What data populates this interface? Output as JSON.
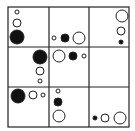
{
  "colors": {
    "line": "#222222",
    "fill": "#111111",
    "background": "#ffffff"
  },
  "grid": {
    "rows": 3,
    "cols": 3,
    "x0": 8,
    "y0": 7,
    "x1": 129,
    "y1": 127,
    "vlines": [
      49,
      89
    ],
    "hlines": [
      47,
      87
    ]
  },
  "cells": [
    {
      "row": 0,
      "col": 0,
      "circles": [
        {
          "cx": 17,
          "cy": 12,
          "r": 2,
          "filled": false
        },
        {
          "cx": 17,
          "cy": 23,
          "r": 4,
          "filled": false
        },
        {
          "cx": 17,
          "cy": 37,
          "r": 7,
          "filled": true
        }
      ]
    },
    {
      "row": 0,
      "col": 1,
      "circles": [
        {
          "cx": 54,
          "cy": 38,
          "r": 2,
          "filled": false
        },
        {
          "cx": 65,
          "cy": 38,
          "r": 4,
          "filled": true
        },
        {
          "cx": 79,
          "cy": 38,
          "r": 6,
          "filled": false
        }
      ]
    },
    {
      "row": 0,
      "col": 2,
      "circles": [
        {
          "cx": 122,
          "cy": 16,
          "r": 6,
          "filled": false
        },
        {
          "cx": 121,
          "cy": 31,
          "r": 4,
          "filled": false
        },
        {
          "cx": 121,
          "cy": 42,
          "r": 2,
          "filled": true
        }
      ]
    },
    {
      "row": 1,
      "col": 0,
      "circles": [
        {
          "cx": 40,
          "cy": 57,
          "r": 7,
          "filled": true
        },
        {
          "cx": 40,
          "cy": 71,
          "r": 4,
          "filled": false
        },
        {
          "cx": 40,
          "cy": 81,
          "r": 2,
          "filled": false
        }
      ]
    },
    {
      "row": 1,
      "col": 1,
      "circles": [
        {
          "cx": 59,
          "cy": 56,
          "r": 6,
          "filled": false
        },
        {
          "cx": 73,
          "cy": 56,
          "r": 4,
          "filled": true
        },
        {
          "cx": 84,
          "cy": 56,
          "r": 2,
          "filled": false
        }
      ]
    },
    {
      "row": 1,
      "col": 2,
      "circles": []
    },
    {
      "row": 2,
      "col": 0,
      "circles": [
        {
          "cx": 18,
          "cy": 96,
          "r": 7,
          "filled": true
        },
        {
          "cx": 33,
          "cy": 95,
          "r": 4,
          "filled": false
        },
        {
          "cx": 43,
          "cy": 95,
          "r": 2,
          "filled": false
        }
      ]
    },
    {
      "row": 2,
      "col": 1,
      "circles": [
        {
          "cx": 58,
          "cy": 91,
          "r": 2,
          "filled": false
        },
        {
          "cx": 58,
          "cy": 102,
          "r": 4,
          "filled": true
        },
        {
          "cx": 59,
          "cy": 116,
          "r": 6,
          "filled": false
        }
      ]
    },
    {
      "row": 2,
      "col": 2,
      "circles": [
        {
          "cx": 95,
          "cy": 118,
          "r": 2,
          "filled": true
        },
        {
          "cx": 105,
          "cy": 118,
          "r": 4,
          "filled": false
        },
        {
          "cx": 120,
          "cy": 118,
          "r": 6,
          "filled": false
        }
      ]
    }
  ]
}
